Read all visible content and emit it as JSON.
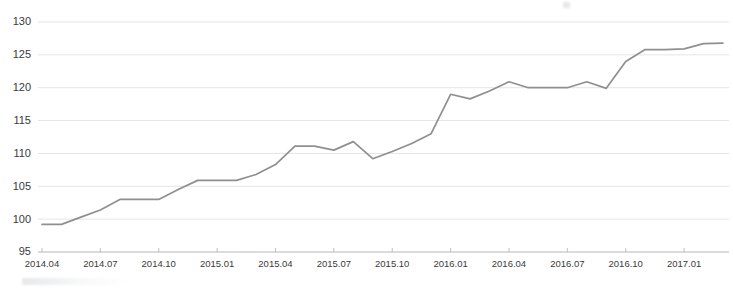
{
  "chart_data": {
    "type": "line",
    "title": "",
    "subtitle": "",
    "xlabel": "",
    "ylabel": "",
    "ylim": [
      95,
      130
    ],
    "ytick_values": [
      95,
      100,
      105,
      110,
      115,
      120,
      125,
      130
    ],
    "ytick_labels": [
      "95",
      "100",
      "105",
      "110",
      "115",
      "120",
      "125",
      "130"
    ],
    "grid": true,
    "legend": false,
    "legend_position": "none",
    "xtick_labels": [
      "2014.04",
      "2014.07",
      "2014.10",
      "2015.01",
      "2015.04",
      "2015.07",
      "2015.10",
      "2016.01",
      "2016.04",
      "2016.07",
      "2016.10",
      "2017.01"
    ],
    "x": [
      "2014.04",
      "2014.05",
      "2014.06",
      "2014.07",
      "2014.08",
      "2014.09",
      "2014.10",
      "2014.11",
      "2014.12",
      "2015.01",
      "2015.02",
      "2015.03",
      "2015.04",
      "2015.05",
      "2015.06",
      "2015.07",
      "2015.08",
      "2015.09",
      "2015.10",
      "2015.11",
      "2015.12",
      "2016.01",
      "2016.02",
      "2016.03",
      "2016.04",
      "2016.05",
      "2016.06",
      "2016.07",
      "2016.08",
      "2016.09",
      "2016.10",
      "2016.11",
      "2016.12",
      "2017.01",
      "2017.02",
      "2017.03"
    ],
    "series": [
      {
        "name": "index",
        "color": "#8f8f8f",
        "values": [
          99.2,
          99.2,
          100.3,
          101.4,
          103.0,
          103.0,
          103.0,
          104.5,
          105.9,
          105.9,
          105.9,
          106.8,
          108.3,
          111.1,
          111.1,
          110.5,
          111.8,
          109.2,
          110.3,
          111.5,
          113.0,
          119.0,
          118.3,
          119.5,
          120.9,
          120.0,
          120.0,
          120.0,
          120.9,
          119.9,
          124.0,
          125.8,
          125.8,
          125.9,
          126.7,
          126.8
        ]
      }
    ],
    "colors": {
      "line": "#8f8f8f",
      "grid": "#d9d9d9",
      "axis": "#b0b0b0",
      "text": "#3a3a3a",
      "background": "#ffffff"
    }
  }
}
